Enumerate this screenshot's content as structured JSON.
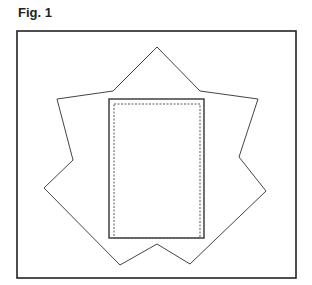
{
  "figure": {
    "label": "Fig. 1"
  },
  "colors": {
    "line": "#333333",
    "frame": "#222222",
    "dashed": "#555555",
    "background": "#ffffff"
  },
  "shapes": {
    "frame": {
      "x": 17,
      "y": 31,
      "width": 279,
      "height": 247
    },
    "star_outline_points": "157,47 200,91 258,99 239,157 266,191 190,264 157,244 120,265 44,188 73,160 57,99 113,91",
    "outer_rect": {
      "x": 109,
      "y": 99,
      "width": 95,
      "height": 139
    },
    "inner_dashed_rect": {
      "x": 114,
      "y": 104,
      "width": 86,
      "height": 134
    }
  }
}
